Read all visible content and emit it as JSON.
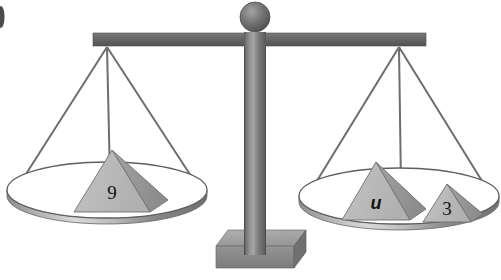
{
  "figure": {
    "type": "balance-scale-diagram",
    "background_color": "#ffffff"
  },
  "colors": {
    "beam": "#6b6b6b",
    "beam_dark": "#555555",
    "post": "#7a7a7a",
    "post_highlight": "#a8a8a8",
    "post_shadow": "#5a5a5a",
    "knob": "#6e6e6e",
    "knob_highlight": "#9a9a9a",
    "base_top": "#a3a3a3",
    "base_front": "#8a8a8a",
    "base_side": "#707070",
    "string": "#6d6d6d",
    "pan_top": "#ffffff",
    "pan_rim": "#5f5f5f",
    "pan_wall_light": "#d8d8d8",
    "pan_wall_dark": "#7c7c7c",
    "pyramid_left_face": "#b9b9b9",
    "pyramid_right_face": "#9a9a9a",
    "pyramid_outline": "#707070",
    "label": "#111111"
  },
  "beam": {
    "name": "balance-beam",
    "x_left": 93,
    "x_right": 426,
    "y_top": 33,
    "height": 13
  },
  "post": {
    "name": "center-post",
    "center_x": 255,
    "top_y": 33,
    "bottom_y": 248,
    "width": 22
  },
  "knob": {
    "name": "post-knob",
    "center_x": 255,
    "center_y": 16,
    "radius": 15
  },
  "base": {
    "name": "scale-base",
    "center_x": 255,
    "top_y": 228,
    "width": 90,
    "height": 22,
    "depth": 16
  },
  "pans": [
    {
      "id": "left-pan",
      "name": "left-pan",
      "side": "left",
      "pivot_x": 107,
      "pivot_y": 46,
      "center_x": 107,
      "rim_y": 190,
      "rim_rx": 100,
      "rim_ry": 28,
      "wall_depth": 22,
      "items": [
        {
          "id": "pyramid-9",
          "name": "pyramid-weight-9",
          "label": "9",
          "label_type": "number",
          "value": "9",
          "apex_x": 112,
          "base_y": 212,
          "half_width": 38,
          "height": 62,
          "depth_x": 18,
          "depth_y": -12
        }
      ]
    },
    {
      "id": "right-pan",
      "name": "right-pan",
      "side": "right",
      "pivot_x": 399,
      "pivot_y": 46,
      "center_x": 399,
      "rim_y": 196,
      "rim_rx": 100,
      "rim_ry": 28,
      "wall_depth": 22,
      "items": [
        {
          "id": "pyramid-u",
          "name": "pyramid-weight-u",
          "label": "u",
          "label_type": "variable",
          "value": "u",
          "apex_x": 376,
          "base_y": 220,
          "half_width": 34,
          "height": 58,
          "depth_x": 16,
          "depth_y": -11
        },
        {
          "id": "pyramid-3",
          "name": "pyramid-weight-3",
          "label": "3",
          "label_type": "number",
          "value": "3",
          "apex_x": 447,
          "base_y": 222,
          "half_width": 24,
          "height": 38,
          "depth_x": 12,
          "depth_y": -8
        }
      ]
    }
  ],
  "strings": {
    "name": "suspension-strings",
    "count_per_pan": 3,
    "color": "#6d6d6d",
    "width": 2
  },
  "artifact": {
    "name": "scan-edge-mark",
    "x": 0,
    "y": 6,
    "width": 5,
    "height": 22
  },
  "equation_implied": {
    "left_side": "9",
    "right_side": "u + 3",
    "relation": "="
  }
}
